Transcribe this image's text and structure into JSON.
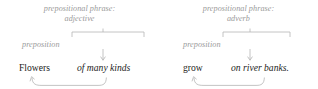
{
  "diagram": {
    "type": "grammar-annotation-diagram",
    "colors": {
      "annotation": "#9a9a9a",
      "text": "#1d1d1b",
      "background": "#ffffff"
    },
    "sentence": "Flowers of many kinds grow on river banks.",
    "groups": [
      {
        "id": "adjective-phrase",
        "phrase_label_line1": "prepositional phrase:",
        "phrase_label_line2": "adjective",
        "preposition_label": "preposition",
        "head_word": "Flowers",
        "phrase_text": "of many kinds",
        "bracket": {
          "x1": 72,
          "x2": 144,
          "y": 32,
          "tick_x": 103,
          "tick_len": 3,
          "arm": 5
        },
        "arrow": {
          "x": 103,
          "y1": 49,
          "y2": 60
        },
        "brace": {
          "start_x": 31,
          "end_x": 106,
          "y_top": 77,
          "y_bottom": 85,
          "arrow_at": "start"
        }
      },
      {
        "id": "adverb-phrase",
        "phrase_label_line1": "prepositional phrase:",
        "phrase_label_line2": "adverb",
        "preposition_label": "preposition",
        "head_word": "grow",
        "phrase_text": "on river banks.",
        "bracket": {
          "x1": 223,
          "x2": 290,
          "y": 32,
          "tick_x": 250,
          "tick_len": 3,
          "arm": 5
        },
        "arrow": {
          "x": 250,
          "y1": 49,
          "y2": 60
        },
        "brace": {
          "start_x": 193,
          "end_x": 264,
          "y_top": 77,
          "y_bottom": 85,
          "arrow_at": "start"
        }
      }
    ]
  }
}
